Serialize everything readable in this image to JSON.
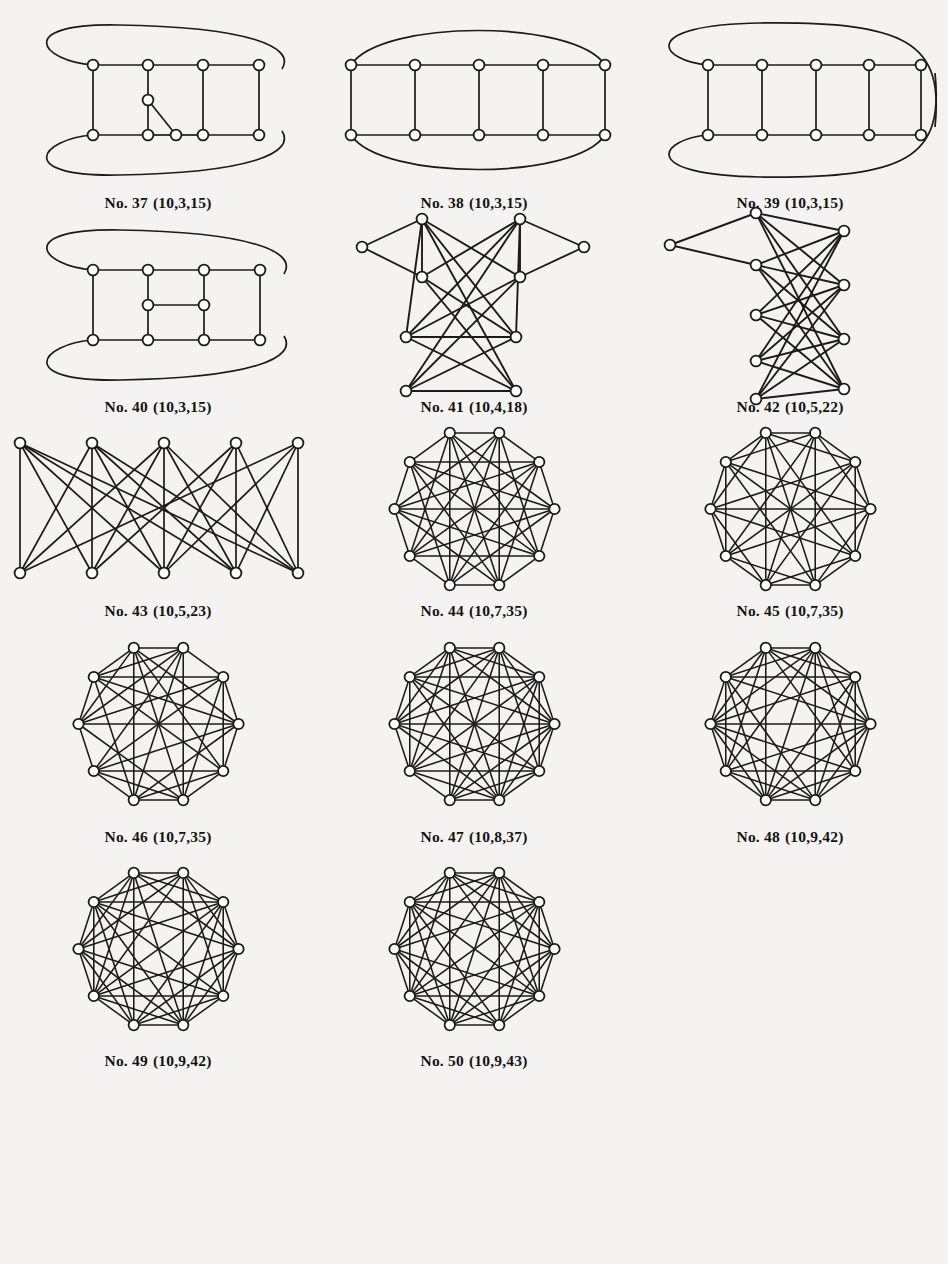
{
  "page": {
    "background_color": "#f4f3f1",
    "ink_color": "#1b1b1b",
    "node_fill": "#ffffff",
    "title_cropped": ""
  },
  "figures": [
    {
      "id": "fig-37",
      "caption_number": "No. 37",
      "caption_params": "(10,3,15)",
      "nodes": 10,
      "edges": 15,
      "degree": 3,
      "layout": "ladder-wrap",
      "cell": {
        "row": 0,
        "col": 0
      }
    },
    {
      "id": "fig-38",
      "caption_number": "No. 38",
      "caption_params": "(10,3,15)",
      "nodes": 10,
      "edges": 15,
      "degree": 3,
      "layout": "ladder-prism",
      "cell": {
        "row": 0,
        "col": 1
      }
    },
    {
      "id": "fig-39",
      "caption_number": "No. 39",
      "caption_params": "(10,3,15)",
      "nodes": 10,
      "edges": 15,
      "degree": 3,
      "layout": "ladder-mobius",
      "cell": {
        "row": 0,
        "col": 2
      }
    },
    {
      "id": "fig-40",
      "caption_number": "No. 40",
      "caption_params": "(10,3,15)",
      "nodes": 10,
      "edges": 15,
      "degree": 3,
      "layout": "ladder-inner-rung",
      "cell": {
        "row": 1,
        "col": 0
      }
    },
    {
      "id": "fig-41",
      "caption_number": "No. 41",
      "caption_params": "(10,4,18)",
      "nodes": 10,
      "edges": 18,
      "degree": 4,
      "layout": "bipartite-y",
      "cell": {
        "row": 1,
        "col": 1
      }
    },
    {
      "id": "fig-42",
      "caption_number": "No. 42",
      "caption_params": "(10,5,22)",
      "nodes": 10,
      "edges": 22,
      "degree": 5,
      "layout": "bipartite-columns",
      "cell": {
        "row": 1,
        "col": 2
      }
    },
    {
      "id": "fig-43",
      "caption_number": "No. 43",
      "caption_params": "(10,5,23)",
      "nodes": 10,
      "edges": 23,
      "degree": 5,
      "layout": "bipartite-rows",
      "cell": {
        "row": 2,
        "col": 0
      }
    },
    {
      "id": "fig-44",
      "caption_number": "No. 44",
      "caption_params": "(10,7,35)",
      "nodes": 10,
      "edges": 35,
      "degree": 7,
      "layout": "circular-dense",
      "cell": {
        "row": 2,
        "col": 1
      }
    },
    {
      "id": "fig-45",
      "caption_number": "No. 45",
      "caption_params": "(10,7,35)",
      "nodes": 10,
      "edges": 35,
      "degree": 7,
      "layout": "circular-dense",
      "cell": {
        "row": 2,
        "col": 2
      }
    },
    {
      "id": "fig-46",
      "caption_number": "No. 46",
      "caption_params": "(10,7,35)",
      "nodes": 10,
      "edges": 35,
      "degree": 7,
      "layout": "circular-dense",
      "cell": {
        "row": 3,
        "col": 0
      }
    },
    {
      "id": "fig-47",
      "caption_number": "No. 47",
      "caption_params": "(10,8,37)",
      "nodes": 10,
      "edges": 37,
      "degree": 8,
      "layout": "circular-dense-onelow",
      "cell": {
        "row": 3,
        "col": 1
      }
    },
    {
      "id": "fig-48",
      "caption_number": "No. 48",
      "caption_params": "(10,9,42)",
      "nodes": 10,
      "edges": 42,
      "degree": 9,
      "layout": "circular-dense",
      "cell": {
        "row": 3,
        "col": 2
      }
    },
    {
      "id": "fig-49",
      "caption_number": "No. 49",
      "caption_params": "(10,9,42)",
      "nodes": 10,
      "edges": 42,
      "degree": 9,
      "layout": "circular-dense",
      "cell": {
        "row": 4,
        "col": 0
      }
    },
    {
      "id": "fig-50",
      "caption_number": "No. 50",
      "caption_params": "(10,9,43)",
      "nodes": 10,
      "edges": 43,
      "degree": 9,
      "layout": "circular-dense",
      "cell": {
        "row": 4,
        "col": 1
      }
    }
  ],
  "chart_data": {
    "type": "diagram",
    "graphs": {
      "fig-37": {
        "positions": [
          [
            95,
            52
          ],
          [
            150,
            52
          ],
          [
            205,
            52
          ],
          [
            260,
            52
          ],
          [
            95,
            122
          ],
          [
            150,
            122
          ],
          [
            205,
            122
          ],
          [
            260,
            122
          ],
          [
            150,
            87
          ],
          [
            178,
            122
          ]
        ],
        "straight_edges": [
          [
            0,
            1
          ],
          [
            1,
            2
          ],
          [
            2,
            3
          ],
          [
            4,
            5
          ],
          [
            5,
            9
          ],
          [
            9,
            6
          ],
          [
            6,
            7
          ],
          [
            0,
            4
          ],
          [
            2,
            6
          ],
          [
            3,
            7
          ],
          [
            1,
            8
          ],
          [
            8,
            5
          ],
          [
            8,
            9
          ]
        ],
        "curve_edges": [
          {
            "from": 0,
            "to": 7,
            "path": "M95,52 C40,52 20,8 150,10 C280,12 300,40 278,58"
          },
          {
            "from": 4,
            "to": 3,
            "path": "M95,122 C40,122 20,165 150,163 C280,161 300,135 278,116"
          }
        ]
      },
      "fig-38": {
        "positions": [
          [
            40,
            52
          ],
          [
            105,
            52
          ],
          [
            170,
            52
          ],
          [
            235,
            52
          ],
          [
            298,
            52
          ],
          [
            40,
            122
          ],
          [
            105,
            122
          ],
          [
            170,
            122
          ],
          [
            235,
            122
          ],
          [
            298,
            122
          ]
        ],
        "straight_edges": [
          [
            0,
            1
          ],
          [
            1,
            2
          ],
          [
            2,
            3
          ],
          [
            3,
            4
          ],
          [
            5,
            6
          ],
          [
            6,
            7
          ],
          [
            7,
            8
          ],
          [
            8,
            9
          ],
          [
            0,
            5
          ],
          [
            1,
            6
          ],
          [
            2,
            7
          ],
          [
            3,
            8
          ],
          [
            4,
            9
          ]
        ],
        "curve_edges": [
          {
            "from": 0,
            "to": 4,
            "path": "M40,52 C70,5 265,5 298,52"
          },
          {
            "from": 5,
            "to": 9,
            "path": "M40,122 C70,170 265,170 298,122"
          }
        ]
      },
      "fig-39": {
        "positions": [
          [
            78,
            52
          ],
          [
            132,
            52
          ],
          [
            186,
            52
          ],
          [
            240,
            52
          ],
          [
            292,
            52
          ],
          [
            78,
            122
          ],
          [
            132,
            122
          ],
          [
            186,
            122
          ],
          [
            240,
            122
          ],
          [
            292,
            122
          ]
        ],
        "straight_edges": [
          [
            0,
            1
          ],
          [
            1,
            2
          ],
          [
            2,
            3
          ],
          [
            3,
            4
          ],
          [
            5,
            6
          ],
          [
            6,
            7
          ],
          [
            7,
            8
          ],
          [
            8,
            9
          ],
          [
            0,
            5
          ],
          [
            1,
            6
          ],
          [
            2,
            7
          ],
          [
            3,
            8
          ],
          [
            4,
            9
          ]
        ],
        "curve_edges": [
          {
            "from": 0,
            "to": 9,
            "path": "M78,52 C30,52 8,10 150,8 C292,6 318,40 308,116"
          },
          {
            "from": 5,
            "to": 4,
            "path": "M78,122 C30,122 8,166 150,168 C292,170 318,130 308,58"
          }
        ]
      },
      "fig-40": {
        "positions": [
          [
            95,
            52
          ],
          [
            150,
            52
          ],
          [
            205,
            52
          ],
          [
            262,
            52
          ],
          [
            95,
            122
          ],
          [
            150,
            122
          ],
          [
            205,
            122
          ],
          [
            262,
            122
          ],
          [
            150,
            87
          ],
          [
            205,
            87
          ]
        ],
        "straight_edges": [
          [
            0,
            1
          ],
          [
            1,
            2
          ],
          [
            2,
            3
          ],
          [
            4,
            5
          ],
          [
            5,
            6
          ],
          [
            6,
            7
          ],
          [
            0,
            4
          ],
          [
            3,
            7
          ],
          [
            1,
            8
          ],
          [
            8,
            5
          ],
          [
            2,
            9
          ],
          [
            9,
            6
          ],
          [
            8,
            9
          ]
        ],
        "curve_edges": [
          {
            "from": 0,
            "to": 7,
            "path": "M95,52 C40,52 20,8 150,10 C282,12 302,42 280,58"
          },
          {
            "from": 4,
            "to": 3,
            "path": "M95,122 C40,122 20,166 150,164 C282,162 302,134 280,116"
          }
        ]
      },
      "fig-41": {
        "positions": [
          [
            85,
            58
          ],
          [
            150,
            25
          ],
          [
            215,
            62
          ],
          [
            255,
            25
          ],
          [
            300,
            58
          ],
          [
            150,
            125
          ],
          [
            215,
            125
          ],
          [
            150,
            172
          ],
          [
            215,
            172
          ]
        ],
        "note": "y-shaped bipartite drawing, 10 nodes",
        "straight_edges": []
      },
      "fig-42": {
        "positions": [],
        "note": "two-column bipartite drawing, 10 nodes, 22 edges"
      },
      "fig-43": {
        "positions": [
          [
            40,
            30
          ],
          [
            110,
            30
          ],
          [
            180,
            30
          ],
          [
            250,
            30
          ],
          [
            318,
            30
          ],
          [
            40,
            150
          ],
          [
            110,
            150
          ],
          [
            180,
            150
          ],
          [
            250,
            150
          ],
          [
            318,
            150
          ]
        ],
        "note": "bipartite 5+5 with 23 edges"
      },
      "circular_common": {
        "radius": 78,
        "center": [
          100,
          100
        ],
        "start_angle_deg": -108,
        "node_count": 10
      }
    }
  }
}
